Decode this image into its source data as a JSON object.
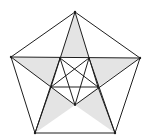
{
  "diagram": {
    "title": "",
    "colors": {
      "background": "#ffffff",
      "stroke": "#1e1e1e",
      "fill": "#e4e4e4"
    },
    "vertices": {
      "outer": {
        "top": [
          75,
          12
        ],
        "left": [
          11,
          57
        ],
        "right": [
          140,
          58
        ],
        "bottom_left": [
          35,
          133
        ],
        "bottom_right": [
          115,
          133
        ]
      },
      "inner": {
        "top_left": [
          60,
          58
        ],
        "top_right": [
          89,
          58
        ],
        "left": [
          51,
          87
        ],
        "right": [
          98,
          87
        ],
        "bottom": [
          75,
          105
        ]
      }
    },
    "shaded_triangles": [
      [
        "outer.top",
        "inner.top_left",
        "inner.top_right"
      ],
      [
        "outer.left",
        "inner.top_left",
        "inner.left"
      ],
      [
        "outer.right",
        "inner.top_right",
        "inner.right"
      ],
      [
        "outer.bottom_left",
        "inner.left",
        "inner.bottom"
      ],
      [
        "outer.bottom_right",
        "inner.right",
        "inner.bottom"
      ]
    ]
  }
}
